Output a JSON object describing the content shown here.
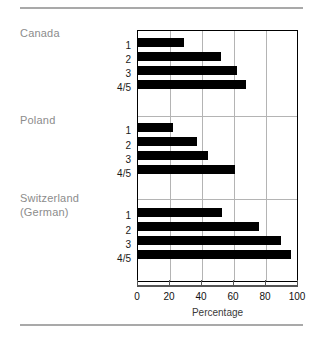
{
  "chart_data": {
    "type": "bar",
    "orientation": "horizontal",
    "title": "",
    "xlabel": "Percentage",
    "ylabel": "",
    "xlim": [
      0,
      100
    ],
    "xticks": [
      0,
      20,
      40,
      60,
      80,
      100
    ],
    "xtick_labels": [
      "0",
      "20",
      "40",
      "60",
      "80",
      "100"
    ],
    "grid": "vertical",
    "legend": "none",
    "bar_color": "#000000",
    "groups": [
      {
        "label": "Canada",
        "categories": [
          "1",
          "2",
          "3",
          "4/5"
        ],
        "values": [
          29,
          52,
          62,
          68
        ]
      },
      {
        "label": "Poland",
        "categories": [
          "1",
          "2",
          "3",
          "4/5"
        ],
        "values": [
          22,
          37,
          44,
          61
        ]
      },
      {
        "label": "Switzerland (German)",
        "label_line1": "Switzerland",
        "label_line2": "(German)",
        "categories": [
          "1",
          "2",
          "3",
          "4/5"
        ],
        "values": [
          53,
          76,
          90,
          96
        ]
      }
    ]
  },
  "groups": {
    "canada": {
      "label": "Canada"
    },
    "poland": {
      "label": "Poland"
    },
    "switzerland": {
      "line1": "Switzerland",
      "line2": "(German)"
    }
  },
  "ticks": {
    "canada": [
      "1",
      "2",
      "3",
      "4/5"
    ],
    "poland": [
      "1",
      "2",
      "3",
      "4/5"
    ],
    "switzerland": [
      "1",
      "2",
      "3",
      "4/5"
    ]
  },
  "xaxis": {
    "labels": [
      "0",
      "20",
      "40",
      "60",
      "80",
      "100"
    ],
    "title": "Percentage"
  }
}
